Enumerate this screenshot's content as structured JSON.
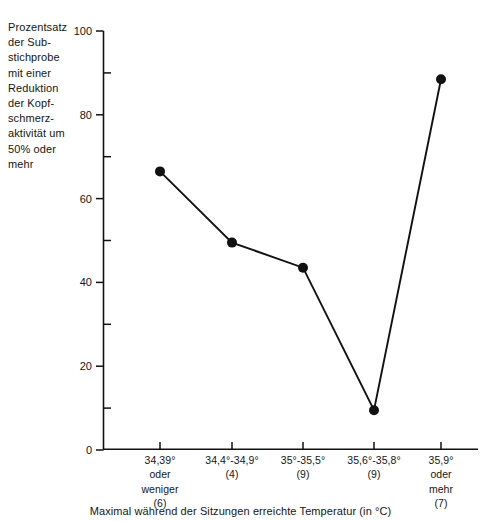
{
  "chart_data": {
    "type": "line",
    "title": "",
    "subtitle": "",
    "xlabel": "Maximal während der Sitzungen erreichte Temperatur (in °C)",
    "ylabel": "Prozentsatz\nder Sub-\nstichprobe\nmit einer\nReduktion\nder Kopf-\nschmerz-\naktivität um\n50% oder\nmehr",
    "categories": [
      "34,39°\noder\nweniger\n(6)",
      "34,4°-34,9°\n(4)",
      "35°-35,5°\n(9)",
      "35,6°-35,8°\n(9)",
      "35,9°\noder\nmehr\n(7)"
    ],
    "category_ranges": [
      "34,39° oder weniger",
      "34,4°-34,9°",
      "35°-35,5°",
      "35,6°-35,8°",
      "35,9° oder mehr"
    ],
    "category_counts": [
      6,
      4,
      9,
      9,
      7
    ],
    "values": [
      66.5,
      49.5,
      43.5,
      9.5,
      88.5
    ],
    "ylim": [
      0,
      100
    ],
    "y_major_ticks": [
      0,
      20,
      40,
      60,
      80,
      100
    ],
    "y_minor_ticks": [
      10,
      30,
      50,
      70,
      90
    ],
    "y_tick_labels": [
      "0",
      "20",
      "40",
      "60",
      "80",
      "100"
    ],
    "grid": false,
    "legend": null,
    "marker": "filled-circle",
    "line_color": "#111111",
    "marker_color": "#111111"
  },
  "axes": {
    "y_caption": "Prozentsatz\nder Sub-\nstichprobe\nmit einer\nReduktion\nder Kopf-\nschmerz-\naktivität um\n50% oder\nmehr",
    "x_title": "Maximal während der Sitzungen erreichte Temperatur (in °C)",
    "y_labels": {
      "t0": "0",
      "t20": "20",
      "t40": "40",
      "t60": "60",
      "t80": "80",
      "t100": "100"
    },
    "x_categories": {
      "c0": "34,39°\noder\nweniger\n(6)",
      "c1": "34,4°-34,9°\n(4)",
      "c2": "35°-35,5°\n(9)",
      "c3": "35,6°-35,8°\n(9)",
      "c4": "35,9°\noder\nmehr\n(7)"
    }
  },
  "colors": {
    "background": "#ffffff",
    "foreground": "#151515",
    "series": "#111111"
  }
}
